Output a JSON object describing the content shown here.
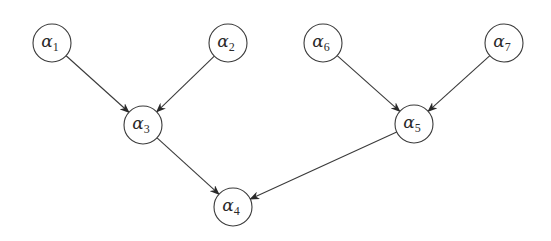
{
  "diagram": {
    "type": "directed-graph",
    "nodes": [
      {
        "id": "a1",
        "symbol": "α",
        "subscript": "1",
        "x": 52,
        "y": 43
      },
      {
        "id": "a2",
        "symbol": "α",
        "subscript": "2",
        "x": 228,
        "y": 43
      },
      {
        "id": "a3",
        "symbol": "α",
        "subscript": "3",
        "x": 143,
        "y": 125
      },
      {
        "id": "a4",
        "symbol": "α",
        "subscript": "4",
        "x": 233,
        "y": 207
      },
      {
        "id": "a5",
        "symbol": "α",
        "subscript": "5",
        "x": 414,
        "y": 124
      },
      {
        "id": "a6",
        "symbol": "α",
        "subscript": "6",
        "x": 323,
        "y": 43
      },
      {
        "id": "a7",
        "symbol": "α",
        "subscript": "7",
        "x": 504,
        "y": 43
      }
    ],
    "edges": [
      {
        "from": "a1",
        "to": "a3"
      },
      {
        "from": "a2",
        "to": "a3"
      },
      {
        "from": "a3",
        "to": "a4"
      },
      {
        "from": "a6",
        "to": "a5"
      },
      {
        "from": "a7",
        "to": "a5"
      },
      {
        "from": "a5",
        "to": "a4"
      }
    ],
    "node_radius": 19,
    "colors": {
      "stroke": "#3a3a3a",
      "background": "#ffffff"
    }
  }
}
